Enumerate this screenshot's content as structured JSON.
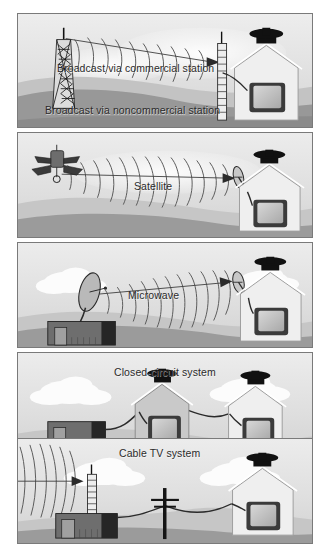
{
  "figure": {
    "background_color": "#ffffff",
    "panel_border_color": "#7a7a7a"
  },
  "panels": [
    {
      "id": "broadcast",
      "captions": [
        {
          "name": "caption-broadcast-commercial",
          "text": "Broadcast via commercial station",
          "x": 56,
          "y": 62
        },
        {
          "name": "caption-broadcast-noncommercial",
          "text": "Broadcast via noncommercial station",
          "x": 44,
          "y": 104
        }
      ],
      "elements": [
        "transmission-tower",
        "radio-waves",
        "arrow",
        "antenna-mast",
        "house",
        "television",
        "hills",
        "cloud"
      ],
      "top": 13,
      "height": 115
    },
    {
      "id": "satellite",
      "captions": [
        {
          "name": "caption-satellite",
          "text": "Satellite",
          "x": 133,
          "y": 185
        }
      ],
      "elements": [
        "satellite",
        "radio-waves",
        "arrow",
        "dish-antenna",
        "house",
        "television",
        "hills",
        "cloud"
      ],
      "top": 132,
      "height": 106
    },
    {
      "id": "microwave",
      "captions": [
        {
          "name": "caption-microwave",
          "text": "Microwave",
          "x": 127,
          "y": 294
        }
      ],
      "elements": [
        "dish-transmitter",
        "station-building",
        "radio-waves",
        "arrow",
        "dish-antenna",
        "house",
        "television",
        "hills",
        "clouds"
      ],
      "top": 242,
      "height": 106
    },
    {
      "id": "closed-circuit",
      "captions": [
        {
          "name": "caption-closed-circuit",
          "text": "Closed-circuit system",
          "x": 113,
          "y": 333
        }
      ],
      "elements": [
        "station-building",
        "cable",
        "house-1",
        "television-1",
        "house-2",
        "television-2",
        "hills",
        "clouds"
      ],
      "top": 352,
      "height": 106
    },
    {
      "id": "cable-tv",
      "captions": [
        {
          "name": "caption-cable-tv",
          "text": "Cable TV system",
          "x": 118,
          "y": 444
        }
      ],
      "elements": [
        "antenna-mast",
        "incoming-waves",
        "headend-building",
        "utility-pole",
        "cable",
        "house",
        "television",
        "hills",
        "cloud"
      ],
      "top": 438,
      "height": 106
    }
  ],
  "colors": {
    "sky_light": "#ececec",
    "sky_mid": "#dedede",
    "ground_far": "#c9c9c9",
    "ground_near": "#9a9a9a",
    "ground_dark": "#8a8a8a",
    "cloud": "#fbfbfb",
    "house_wall": "#eeeeee",
    "house_outline": "#9b9b9b",
    "roof_cap": "#141414",
    "tv_bezel": "#3a3a3a",
    "tv_screen": "#c6c6c6",
    "building_body": "#6e6e6e",
    "building_dark": "#2a2a2a",
    "building_door": "#8d8d8d",
    "wave_stroke": "#4a4a4a",
    "cable": "#2b2b2b",
    "tower": "#111111",
    "caption_text": "#2b2b2b"
  }
}
